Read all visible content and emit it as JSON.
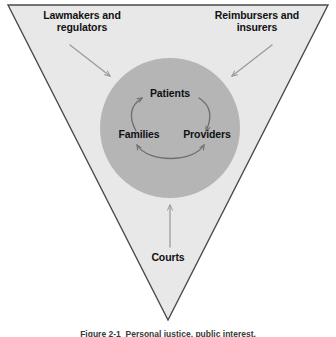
{
  "figure": {
    "caption": "Figure 2-1  Personal justice, public interest.",
    "colors": {
      "triangle_fill": "#e8e8e8",
      "triangle_stroke": "#4a4a4a",
      "circle_fill": "#b5b5b5",
      "arrow_outer": "#9a9a9a",
      "arrow_inner": "#6e6e6e",
      "text": "#111111",
      "background": "#ffffff"
    }
  },
  "outer_labels": [
    {
      "id": "lawmakers",
      "text": "Lawmakers and\nregulators",
      "position": "top-left"
    },
    {
      "id": "reimbursers",
      "text": "Reimbursers and\ninsurers",
      "position": "top-right"
    },
    {
      "id": "courts",
      "text": "Courts",
      "position": "bottom-center"
    }
  ],
  "inner_labels": [
    {
      "id": "patients",
      "text": "Patients",
      "position": "top"
    },
    {
      "id": "families",
      "text": "Families",
      "position": "left"
    },
    {
      "id": "providers",
      "text": "Providers",
      "position": "right"
    }
  ],
  "arrows": {
    "external": [
      {
        "id": "lawmakers-to-core",
        "from": "Lawmakers and regulators",
        "to": "core circle",
        "direction": "down-right",
        "heads": 1
      },
      {
        "id": "reimbursers-to-core",
        "from": "Reimbursers and insurers",
        "to": "core circle",
        "direction": "down-left",
        "heads": 1
      },
      {
        "id": "courts-to-core",
        "from": "Courts",
        "to": "core circle",
        "direction": "up",
        "heads": 1
      }
    ],
    "internal": [
      {
        "id": "families-to-patients",
        "from": "Families",
        "to": "Patients",
        "heads": 1
      },
      {
        "id": "patients-to-providers",
        "from": "Patients",
        "to": "Providers",
        "heads": 1
      },
      {
        "id": "families-providers",
        "from": "Families",
        "to": "Providers",
        "heads": 2,
        "bidirectional": true
      }
    ]
  },
  "geometry": {
    "triangle_vertices": "8,5 328,5 168,320",
    "circle_center_x": 170,
    "circle_center_y": 128,
    "circle_radius": 70
  }
}
